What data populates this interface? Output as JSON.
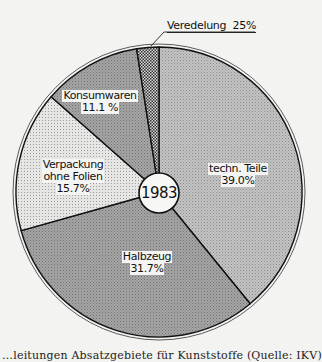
{
  "chart_data": {
    "type": "pie",
    "title": "",
    "center_label": "1983",
    "start_angle_deg": 0,
    "direction": "clockwise",
    "slices": [
      {
        "name": "techn. Teile",
        "value": 39.0,
        "label": "39.0%",
        "color": "#bebebe",
        "pattern": "fine-dots"
      },
      {
        "name": "Halbzeug",
        "value": 31.7,
        "label": "31.7%",
        "color": "#a2a2a2",
        "pattern": "fine-dots"
      },
      {
        "name": "Verpackung ohne Folien",
        "value": 15.7,
        "label": "15.7%",
        "color": "#e4e4e2",
        "pattern": "sparse-dots"
      },
      {
        "name": "Konsumwaren",
        "value": 11.1,
        "label": "11.1 %",
        "color": "#9b9b9b",
        "pattern": "fine-dots"
      },
      {
        "name": "Veredelung",
        "value": 2.5,
        "label": "25%",
        "color": "#6f6f6f",
        "pattern": "checker"
      }
    ],
    "legend": "none (labels inside slices; Veredelung via callout)",
    "caption": "Absatzgebiete für Kunststoffe (Quelle: IKV)"
  },
  "labels": {
    "techn": {
      "line1": "techn. Teile",
      "line2": "39.0%"
    },
    "halbzeug": {
      "line1": "Halbzeug",
      "line2": "31.7%"
    },
    "verpackung": {
      "line1": "Verpackung",
      "line2": "ohne Folien",
      "line3": "15.7%"
    },
    "konsum": {
      "line1": "Konsumwaren",
      "line2": "11.1 %"
    },
    "veredelung": {
      "text": "Veredelung  25%"
    },
    "center": "1983"
  },
  "caption": "…leitungen Absatzgebiete für Kunststoffe (Quelle: IKV)"
}
